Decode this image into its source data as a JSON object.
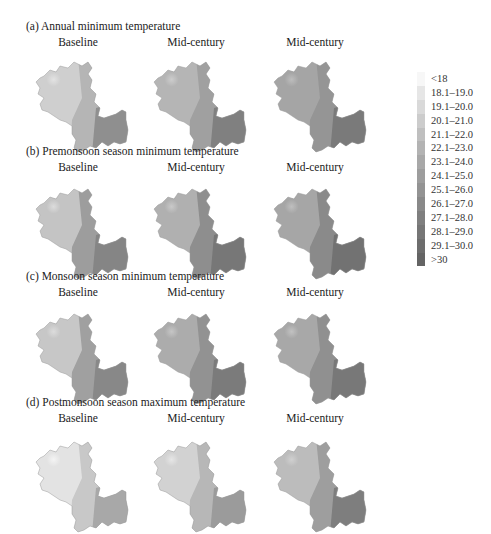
{
  "chart_data": {
    "type": "choropleth-map-grid",
    "panels": [
      {
        "title": "(a) Annual minimum temperature",
        "columns": [
          "Baseline",
          "Mid-century",
          "Mid-century"
        ],
        "shades": [
          [
            "#e3e3e3",
            "#cfcfcf",
            "#b5b5b5",
            "#8f8f8f"
          ],
          [
            "#cdcdcd",
            "#b5b5b5",
            "#a0a0a0",
            "#808080"
          ],
          [
            "#bdbdbd",
            "#a5a5a5",
            "#959595",
            "#7a7a7a"
          ]
        ]
      },
      {
        "title": "(b) Premonsoon season minimum temperature",
        "columns": [
          "Baseline",
          "Mid-century",
          "Mid-century"
        ],
        "shades": [
          [
            "#dcdcdc",
            "#c4c4c4",
            "#9d9d9d",
            "#858585"
          ],
          [
            "#c9c9c9",
            "#b0b0b0",
            "#8e8e8e",
            "#777777"
          ],
          [
            "#bfbfbf",
            "#a6a6a6",
            "#8a8a8a",
            "#727272"
          ]
        ]
      },
      {
        "title": "(c) Monsoon season minimum temperature",
        "columns": [
          "Baseline",
          "Mid-century",
          "Mid-century"
        ],
        "shades": [
          [
            "#dcdcdc",
            "#c7c7c7",
            "#a0a0a0",
            "#888888"
          ],
          [
            "#c6c6c6",
            "#acacac",
            "#929292",
            "#7b7b7b"
          ],
          [
            "#c2c2c2",
            "#a8a8a8",
            "#909090",
            "#787878"
          ]
        ]
      },
      {
        "title": "(d) Postmonsoon season maximum temperature",
        "columns": [
          "Baseline",
          "Mid-century",
          "Mid-century"
        ],
        "shades": [
          [
            "#f4f4f4",
            "#e3e3e3",
            "#c8c8c8",
            "#a8a8a8"
          ],
          [
            "#e6e6e6",
            "#d2d2d2",
            "#b7b7b7",
            "#9b9b9b"
          ],
          [
            "#d0d0d0",
            "#bcbcbc",
            "#9e9e9e",
            "#7e7e7e"
          ]
        ]
      }
    ],
    "legend": {
      "title": "",
      "position": "right",
      "entries": [
        {
          "label": "<18",
          "color": "#f7f7f7"
        },
        {
          "label": "18.1–19.0",
          "color": "#e6e6e6"
        },
        {
          "label": "19.1–20.0",
          "color": "#d9d9d9"
        },
        {
          "label": "20.1–21.0",
          "color": "#cccccc"
        },
        {
          "label": "21.1–22.0",
          "color": "#bfbfbf"
        },
        {
          "label": "22.1–23.0",
          "color": "#b3b3b3"
        },
        {
          "label": "23.1–24.0",
          "color": "#a8a8a8"
        },
        {
          "label": "24.1–25.0",
          "color": "#9d9d9d"
        },
        {
          "label": "25.1–26.0",
          "color": "#939393"
        },
        {
          "label": "26.1–27.0",
          "color": "#898989"
        },
        {
          "label": "27.1–28.0",
          "color": "#7f7f7f"
        },
        {
          "label": "28.1–29.0",
          "color": "#767676"
        },
        {
          "label": "29.1–30.0",
          "color": "#6d6d6d"
        },
        {
          "label": ">30",
          "color": "#646464"
        }
      ]
    }
  }
}
